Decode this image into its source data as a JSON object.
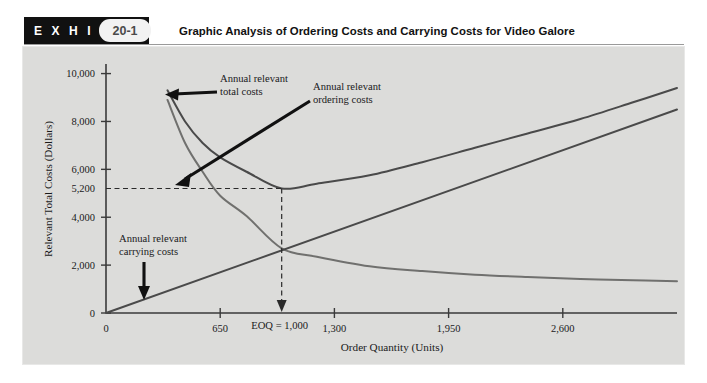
{
  "exhibit": {
    "badge_word": "E X H I B I T",
    "number": "20-1",
    "title": "Graphic Analysis of Ordering Costs and Carrying Costs for Video Galore"
  },
  "colors": {
    "panel_bg": "#dcdcda",
    "badge_bg": "#111111",
    "total_cost_line": "#4a4a4a",
    "ordering_cost_line": "#6e6e6e",
    "carrying_cost_line": "#4a4a4a",
    "axis": "#3a3a3a",
    "dashed": "#2a2a2a"
  },
  "chart_data": {
    "type": "line",
    "title": "Graphic Analysis of Ordering Costs and Carrying Costs for Video Galore",
    "xlabel": "Order Quantity (Units)",
    "ylabel": "Relevant Total Costs (Dollars)",
    "xlim": [
      0,
      3250
    ],
    "ylim": [
      0,
      10400
    ],
    "xticks": [
      "0",
      "650",
      "1,300",
      "1,950",
      "2,600"
    ],
    "xtick_values": [
      0,
      650,
      1300,
      1950,
      2600
    ],
    "yticks": [
      "0",
      "2,000",
      "4,000",
      "5,200",
      "6,000",
      "8,000",
      "10,000"
    ],
    "ytick_values": [
      0,
      2000,
      4000,
      5200,
      6000,
      8000,
      10000
    ],
    "grid": false,
    "legend": "none",
    "eoq": {
      "label": "EOQ = 1,000",
      "quantity": 1000,
      "total_cost": 5200
    },
    "series": [
      {
        "name": "Annual relevant total costs",
        "kind": "curve",
        "x": [
          350,
          450,
          550,
          650,
          800,
          1000,
          1200,
          1500,
          1800,
          2100,
          2400,
          2700,
          3000,
          3250
        ],
        "y": [
          9300,
          8000,
          7100,
          6500,
          5900,
          5200,
          5400,
          5750,
          6300,
          6900,
          7500,
          8100,
          8800,
          9400
        ]
      },
      {
        "name": "Annual relevant ordering costs",
        "kind": "curve",
        "x": [
          350,
          450,
          550,
          650,
          800,
          1000,
          1200,
          1500,
          1800,
          2100,
          2400,
          2700,
          3000,
          3250
        ],
        "y": [
          8900,
          7100,
          5900,
          4900,
          4050,
          2700,
          2350,
          1950,
          1750,
          1600,
          1500,
          1420,
          1370,
          1330
        ]
      },
      {
        "name": "Annual relevant carrying costs",
        "kind": "line",
        "x": [
          0,
          3250
        ],
        "y": [
          0,
          8500
        ]
      }
    ],
    "annotations": [
      {
        "id": "total-costs",
        "text_line1": "Annual relevant",
        "text_line2": "total costs",
        "arrow": "points-left-to-total-cost-curve"
      },
      {
        "id": "ordering-costs",
        "text_line1": "Annual relevant",
        "text_line2": "ordering costs",
        "arrow": "points-down-left-to-ordering-cost-curve"
      },
      {
        "id": "carrying-costs",
        "text_line1": "Annual relevant",
        "text_line2": "carrying costs",
        "arrow": "points-down-to-carrying-cost-line"
      }
    ]
  }
}
